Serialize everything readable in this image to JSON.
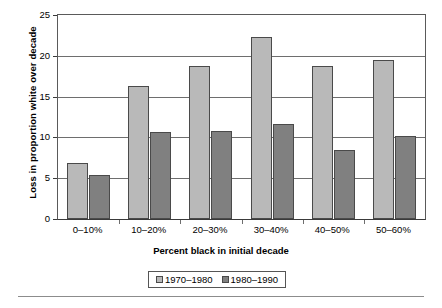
{
  "chart_data": {
    "type": "bar",
    "title": "",
    "subtitle": "",
    "xlabel": "Percent black in initial decade",
    "ylabel": "Loss in proportion white over decade",
    "categories": [
      "0–10%",
      "10–20%",
      "20–30%",
      "30–40%",
      "40–50%",
      "50–60%"
    ],
    "series": [
      {
        "name": "1970–1980",
        "color": "#b9b9b9",
        "values": [
          6.9,
          16.3,
          18.7,
          22.3,
          18.7,
          19.5
        ]
      },
      {
        "name": "1980–1990",
        "color": "#808080",
        "values": [
          5.4,
          10.7,
          10.8,
          11.7,
          8.5,
          10.2
        ]
      }
    ],
    "ylim": [
      0,
      25
    ],
    "yticks": [
      0,
      5,
      10,
      15,
      20,
      25
    ],
    "ytick_labels": [
      "0",
      "5",
      "10",
      "15",
      "20",
      "25"
    ],
    "grid": "horizontal",
    "legend_position": "bottom-center",
    "legend_entries": [
      "1970–1980",
      "1980–1990"
    ]
  },
  "axes": {
    "y_title": "Loss in proportion white over decade",
    "x_title": "Percent black in initial decade"
  }
}
